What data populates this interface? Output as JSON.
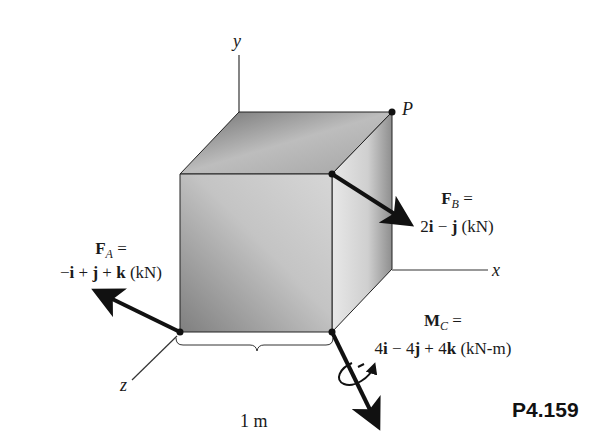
{
  "figure": {
    "problem_id": "P4.159",
    "axes": {
      "x": "x",
      "y": "y",
      "z": "z"
    },
    "point_label": "P",
    "dimension_label": "1 m",
    "force_A": {
      "symbol": "F",
      "subscript": "A",
      "equals": "=",
      "expression": "−i + j + k (kN)",
      "terms": [
        "−",
        "i",
        " + ",
        "j",
        " + ",
        "k",
        " (kN)"
      ]
    },
    "force_B": {
      "symbol": "F",
      "subscript": "B",
      "equals": "=",
      "expression": "2i − j (kN)",
      "terms": [
        "2",
        "i",
        " − ",
        "j",
        " (kN)"
      ]
    },
    "moment_C": {
      "symbol": "M",
      "subscript": "C",
      "equals": "=",
      "expression": "4i − 4j + 4k (kN-m)",
      "terms": [
        "4",
        "i",
        " − 4",
        "j",
        " + 4",
        "k",
        " (kN-m)"
      ]
    },
    "colors": {
      "cube_front_dark": "#8a8a8a",
      "cube_front_light": "#d9d9d9",
      "cube_top": "#a8a8a8",
      "cube_side": "#e0e0e0",
      "ink": "#111111"
    }
  }
}
